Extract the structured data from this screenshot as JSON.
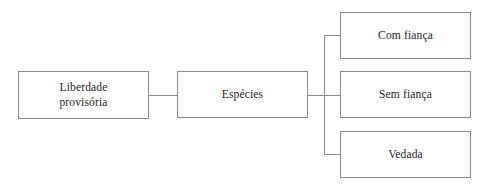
{
  "diagram": {
    "type": "tree",
    "orientation": "left-to-right",
    "background_color": "#ffffff",
    "line_color": "#8a8a8a",
    "text_color": "#1c1c1c",
    "nodes": [
      {
        "id": "root",
        "label": "Liberdade\nprovisória",
        "level": 0
      },
      {
        "id": "especies",
        "label": "Espécies",
        "level": 1
      },
      {
        "id": "com",
        "label": "Com fiança",
        "level": 2
      },
      {
        "id": "sem",
        "label": "Sem fiança",
        "level": 2
      },
      {
        "id": "vedada",
        "label": "Vedada",
        "level": 2
      }
    ],
    "edges": [
      {
        "from": "root",
        "to": "especies"
      },
      {
        "from": "especies",
        "to": "com"
      },
      {
        "from": "especies",
        "to": "sem"
      },
      {
        "from": "especies",
        "to": "vedada"
      }
    ]
  }
}
